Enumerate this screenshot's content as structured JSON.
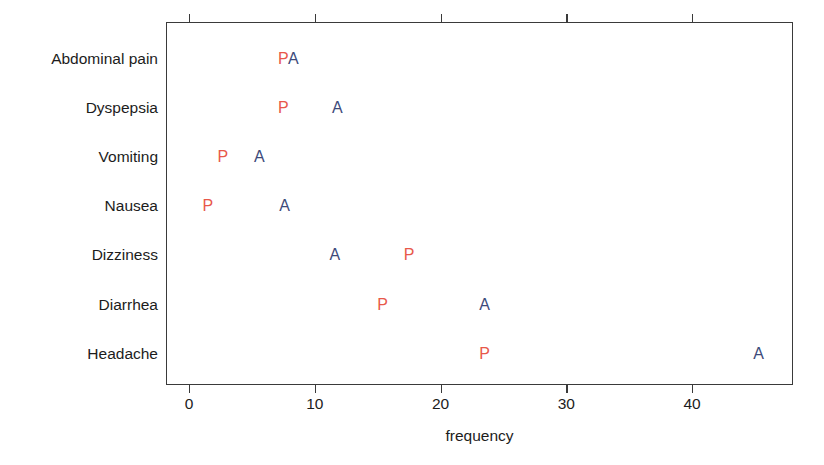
{
  "figure": {
    "x_axis_title": "frequency",
    "x_ticks": [
      {
        "label": "0",
        "value": 0
      },
      {
        "label": "10",
        "value": 10
      },
      {
        "label": "20",
        "value": 20
      },
      {
        "label": "30",
        "value": 30
      },
      {
        "label": "40",
        "value": 40
      }
    ],
    "categories": [
      "Abdominal pain",
      "Dyspepsia",
      "Vomiting",
      "Nausea",
      "Dizziness",
      "Diarrhea",
      "Headache"
    ],
    "series_glyphs": [
      {
        "key": "P",
        "label": "P",
        "color": "#e8584a"
      },
      {
        "key": "A",
        "label": "A",
        "color": "#3d4a7a"
      }
    ]
  },
  "chart_data": {
    "type": "scatter",
    "title": "",
    "subtitle": "",
    "xlabel": "frequency",
    "ylabel": "",
    "xlim": [
      -1.5,
      48
    ],
    "xticks": [
      0,
      10,
      20,
      30,
      40
    ],
    "xticklabels": [
      "0",
      "10",
      "20",
      "30",
      "40"
    ],
    "grid": false,
    "legend": "none",
    "point_marker": "letter",
    "categories": [
      "Abdominal pain",
      "Dyspepsia",
      "Vomiting",
      "Nausea",
      "Dizziness",
      "Diarrhea",
      "Headache"
    ],
    "series": [
      {
        "name": "P",
        "description": "Placebo",
        "color": "#e8584a",
        "marker_text": "P",
        "values": [
          7.5,
          7.5,
          2.7,
          1.5,
          17.5,
          15.4,
          23.5
        ]
      },
      {
        "name": "A",
        "description": "Active drug",
        "color": "#3d4a7a",
        "marker_text": "A",
        "values": [
          8.3,
          11.8,
          5.6,
          7.6,
          11.6,
          23.5,
          45.3
        ]
      }
    ],
    "points": [
      {
        "category": "Abdominal pain",
        "series": "P",
        "x": 7.5
      },
      {
        "category": "Abdominal pain",
        "series": "A",
        "x": 8.3
      },
      {
        "category": "Dyspepsia",
        "series": "P",
        "x": 7.5
      },
      {
        "category": "Dyspepsia",
        "series": "A",
        "x": 11.8
      },
      {
        "category": "Vomiting",
        "series": "P",
        "x": 2.7
      },
      {
        "category": "Vomiting",
        "series": "A",
        "x": 5.6
      },
      {
        "category": "Nausea",
        "series": "P",
        "x": 1.5
      },
      {
        "category": "Nausea",
        "series": "A",
        "x": 7.6
      },
      {
        "category": "Dizziness",
        "series": "A",
        "x": 11.6
      },
      {
        "category": "Dizziness",
        "series": "P",
        "x": 17.5
      },
      {
        "category": "Diarrhea",
        "series": "P",
        "x": 15.4
      },
      {
        "category": "Diarrhea",
        "series": "A",
        "x": 23.5
      },
      {
        "category": "Headache",
        "series": "P",
        "x": 23.5
      },
      {
        "category": "Headache",
        "series": "A",
        "x": 45.3
      }
    ]
  }
}
